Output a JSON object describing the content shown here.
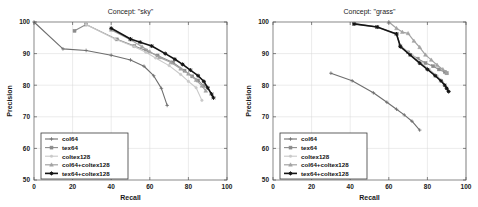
{
  "figure": {
    "panels": [
      "sky",
      "grass"
    ]
  },
  "chart_data": [
    {
      "type": "line",
      "title": "Concept: \"sky\"",
      "xlabel": "Recall",
      "ylabel": "Precision",
      "xlim": [
        0,
        100
      ],
      "ylim": [
        50,
        100
      ],
      "xticks": [
        0,
        20,
        40,
        60,
        80,
        100
      ],
      "yticks": [
        50,
        60,
        70,
        80,
        90,
        100
      ],
      "grid": true,
      "legend_position": "lower-left",
      "series": [
        {
          "name": "col64",
          "color": "#6e6e6e",
          "width": 1.1,
          "marker": "cross",
          "x": [
            0,
            15,
            27,
            40,
            50,
            57,
            62,
            66,
            69
          ],
          "y": [
            100,
            91.5,
            91,
            89.5,
            88,
            86,
            83,
            79,
            73.6
          ]
        },
        {
          "name": "tex64",
          "color": "#8c8c8c",
          "width": 1.1,
          "marker": "square",
          "x": [
            21,
            27,
            43,
            52,
            58,
            64,
            72,
            78,
            82,
            85,
            88
          ],
          "y": [
            97.2,
            99.2,
            94.5,
            92.4,
            91,
            89.4,
            87.2,
            84.6,
            82.8,
            81.5,
            79.8
          ]
        },
        {
          "name": "coltex128",
          "color": "#c9c9c9",
          "width": 1.1,
          "marker": "dot",
          "x": [
            27,
            42,
            52,
            58,
            63,
            70,
            76,
            80,
            84,
            87
          ],
          "y": [
            99.2,
            94.6,
            92.2,
            90.4,
            88.6,
            86.2,
            83.4,
            81.2,
            79.2,
            75.2
          ]
        },
        {
          "name": "col64+coltex128",
          "color": "#a3a3a3",
          "width": 1.2,
          "marker": "triangle",
          "x": [
            40,
            50,
            56,
            60,
            65,
            71,
            76,
            80,
            84,
            87,
            89
          ],
          "y": [
            97.5,
            94.4,
            92.2,
            90.6,
            88.8,
            87.2,
            85.2,
            83.6,
            81.6,
            79.8,
            78.2
          ]
        },
        {
          "name": "tex64+coltex128",
          "color": "#141414",
          "width": 1.6,
          "marker": "star",
          "x": [
            40,
            50,
            55,
            61,
            68,
            73,
            77,
            81,
            85,
            88,
            90,
            92,
            93
          ],
          "y": [
            98.0,
            94.6,
            93.6,
            92.4,
            90.0,
            88.2,
            86.6,
            84.8,
            83.0,
            81.2,
            79.2,
            77.2,
            76.0
          ]
        }
      ]
    },
    {
      "type": "line",
      "title": "Concept: \"grass\"",
      "xlabel": "Recall",
      "ylabel": "Precision",
      "xlim": [
        0,
        100
      ],
      "ylim": [
        50,
        100
      ],
      "xticks": [
        0,
        20,
        40,
        60,
        80,
        100
      ],
      "yticks": [
        50,
        60,
        70,
        80,
        90,
        100
      ],
      "grid": true,
      "legend_position": "lower-left",
      "series": [
        {
          "name": "col64",
          "color": "#6e6e6e",
          "width": 1.1,
          "marker": "cross",
          "x": [
            30,
            41,
            52,
            59,
            64,
            68,
            72,
            76
          ],
          "y": [
            83.8,
            81.4,
            77.6,
            74.6,
            72.4,
            70.6,
            68.6,
            65.8
          ]
        },
        {
          "name": "tex64",
          "color": "#8c8c8c",
          "width": 1.1,
          "marker": "square",
          "x": [
            42,
            54,
            64,
            66,
            70,
            75,
            79,
            83,
            86,
            89,
            90
          ],
          "y": [
            99.4,
            98.4,
            96.2,
            92.4,
            90.4,
            88.4,
            87.0,
            86.0,
            85.0,
            84.2,
            83.8
          ]
        },
        {
          "name": "coltex128",
          "color": "#c9c9c9",
          "width": 1.1,
          "marker": "dot",
          "x": [
            43,
            54,
            64,
            66,
            72,
            77,
            81,
            85,
            88,
            90
          ],
          "y": [
            99.4,
            98.4,
            96.0,
            92.6,
            89.6,
            87.0,
            85.0,
            83.0,
            81.0,
            79.2
          ]
        },
        {
          "name": "col64+coltex128",
          "color": "#a3a3a3",
          "width": 1.2,
          "marker": "triangle",
          "x": [
            60,
            64,
            67,
            70,
            73,
            76,
            79,
            82,
            85,
            88,
            90
          ],
          "y": [
            100.0,
            98.0,
            96.8,
            96.4,
            94.0,
            92.0,
            89.6,
            88.0,
            86.4,
            85.0,
            83.8
          ]
        },
        {
          "name": "tex64+coltex128",
          "color": "#141414",
          "width": 1.6,
          "marker": "star",
          "x": [
            42,
            54,
            64,
            66,
            71,
            76,
            80,
            84,
            87,
            89,
            90,
            91
          ],
          "y": [
            99.4,
            98.4,
            96.2,
            92.2,
            89.6,
            87.0,
            85.0,
            83.0,
            81.4,
            80.0,
            79.0,
            78.0
          ]
        }
      ]
    }
  ]
}
